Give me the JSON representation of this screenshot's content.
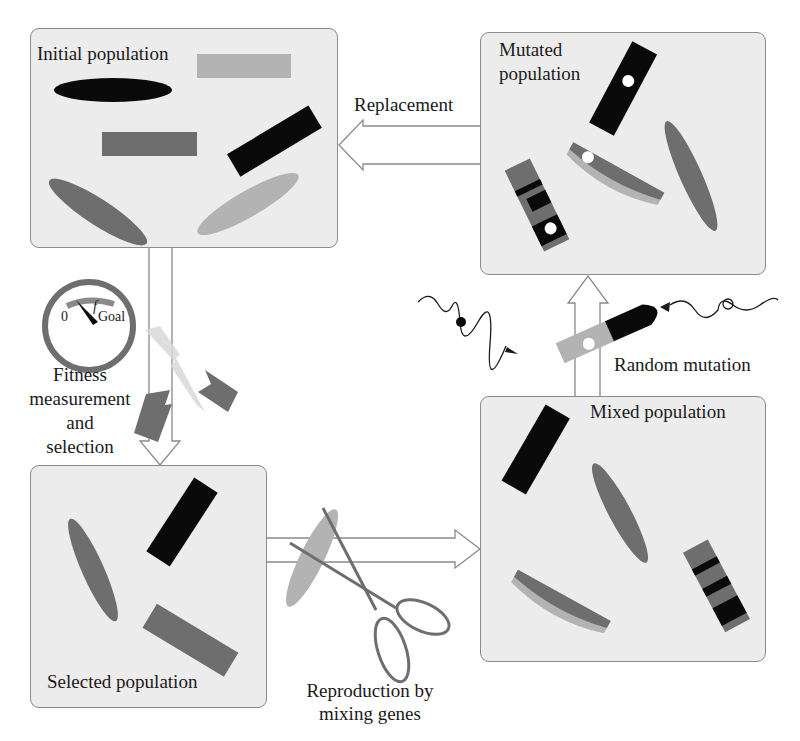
{
  "diagram": {
    "type": "genetic-algorithm-cycle",
    "colors": {
      "box_fill": "#ececec",
      "box_border": "#8a8a8a",
      "black": "#0a0a0a",
      "dark_gray": "#6e6e6e",
      "light_gray": "#b3b3b3",
      "arrow_stroke": "#8a8a8a"
    },
    "nodes": [
      {
        "id": "initial",
        "label": "Initial population"
      },
      {
        "id": "mutated",
        "label_line1": "Mutated",
        "label_line2": "population"
      },
      {
        "id": "selected",
        "label": "Selected population"
      },
      {
        "id": "mixed",
        "label": "Mixed population"
      }
    ],
    "edges": [
      {
        "from": "initial",
        "to": "selected",
        "label_lines": [
          "Fitness",
          "measurement",
          "and",
          "selection"
        ]
      },
      {
        "from": "selected",
        "to": "mixed",
        "label_lines": [
          "Reproduction by",
          "mixing genes"
        ]
      },
      {
        "from": "mixed",
        "to": "mutated",
        "label": "Random mutation"
      },
      {
        "from": "mutated",
        "to": "initial",
        "label": "Replacement"
      }
    ],
    "gauge": {
      "min_label": "0",
      "symbol": "f",
      "max_label": "Goal"
    }
  }
}
